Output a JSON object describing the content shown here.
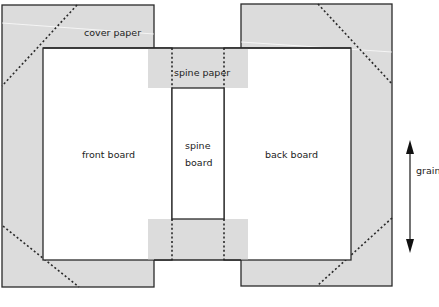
{
  "diagram": {
    "labels": {
      "cover_paper": "cover paper",
      "spine_paper": "spine paper",
      "front_board": "front board",
      "spine_board_line1": "spine",
      "spine_board_line2": "board",
      "back_board": "back board",
      "grain": "grain"
    },
    "colors": {
      "paper_fill": "#dcdcdc",
      "board_fill": "#ffffff",
      "outline": "#2a2a2a",
      "fold_line": "#2a2a2a"
    },
    "icons": {
      "grain_arrow": "double-headed-vertical-arrow"
    }
  }
}
